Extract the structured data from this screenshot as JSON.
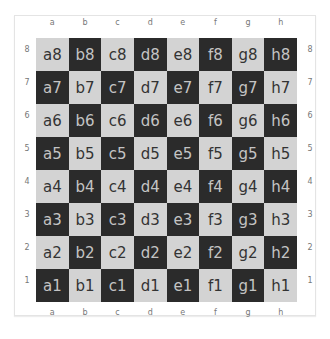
{
  "board": {
    "files": [
      "a",
      "b",
      "c",
      "d",
      "e",
      "f",
      "g",
      "h"
    ],
    "ranks": [
      "8",
      "7",
      "6",
      "5",
      "4",
      "3",
      "2",
      "1"
    ],
    "colors": {
      "light": "#d3d3d3",
      "dark": "#2b2b2b"
    },
    "squares": [
      [
        "a8",
        "b8",
        "c8",
        "d8",
        "e8",
        "f8",
        "g8",
        "h8"
      ],
      [
        "a7",
        "b7",
        "c7",
        "d7",
        "e7",
        "f7",
        "g7",
        "h7"
      ],
      [
        "a6",
        "b6",
        "c6",
        "d6",
        "e6",
        "f6",
        "g6",
        "h6"
      ],
      [
        "a5",
        "b5",
        "c5",
        "d5",
        "e5",
        "f5",
        "g5",
        "h5"
      ],
      [
        "a4",
        "b4",
        "c4",
        "d4",
        "e4",
        "f4",
        "g4",
        "h4"
      ],
      [
        "a3",
        "b3",
        "c3",
        "d3",
        "e3",
        "f3",
        "g3",
        "h3"
      ],
      [
        "a2",
        "b2",
        "c2",
        "d2",
        "e2",
        "f2",
        "g2",
        "h2"
      ],
      [
        "a1",
        "b1",
        "c1",
        "d1",
        "e1",
        "f1",
        "g1",
        "h1"
      ]
    ]
  }
}
